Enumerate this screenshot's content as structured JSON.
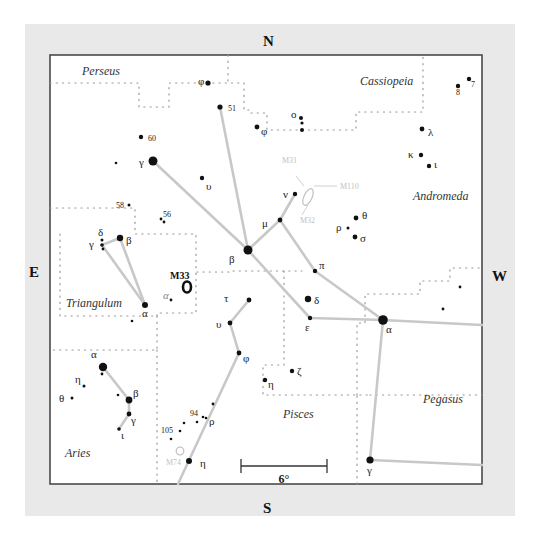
{
  "compass": {
    "north": "N",
    "south": "S",
    "east": "E",
    "west": "W"
  },
  "scale_bar": {
    "label": "6°"
  },
  "constellations": [
    {
      "name": "Perseus",
      "x": 82,
      "y": 75
    },
    {
      "name": "Cassiopeia",
      "x": 360,
      "y": 85
    },
    {
      "name": "Andromeda",
      "x": 413,
      "y": 200
    },
    {
      "name": "Triangulum",
      "x": 66,
      "y": 307
    },
    {
      "name": "Pisces",
      "x": 283,
      "y": 418
    },
    {
      "name": "Pegasus",
      "x": 423,
      "y": 403
    },
    {
      "name": "Aries",
      "x": 65,
      "y": 457
    }
  ],
  "deep_sky": [
    {
      "name": "M33",
      "label": "M33",
      "x": 187,
      "y": 287,
      "kind": "galaxy-bold",
      "lx": 170,
      "ly": 279
    },
    {
      "name": "M31",
      "label": "M31",
      "x": 308,
      "y": 197,
      "kind": "galaxy-faint",
      "lx": 282,
      "ly": 163
    },
    {
      "name": "M32",
      "label": "M32",
      "x": 308,
      "y": 197,
      "kind": "label-faint",
      "lx": 300,
      "ly": 223
    },
    {
      "name": "M110",
      "label": "M110",
      "x": 308,
      "y": 197,
      "kind": "label-faint",
      "lx": 340,
      "ly": 189
    },
    {
      "name": "M74",
      "label": "M74",
      "x": 180,
      "y": 451,
      "kind": "cluster-faint",
      "lx": 166,
      "ly": 465
    }
  ],
  "stars": [
    {
      "id": "per-phi",
      "label": "φ",
      "x": 208,
      "y": 83,
      "r": 2.6,
      "lx": 198,
      "ly": 85
    },
    {
      "id": "per-51",
      "label": "51",
      "x": 220,
      "y": 107,
      "r": 2.6,
      "lx": 228,
      "ly": 111
    },
    {
      "id": "per-60",
      "label": "60",
      "x": 141,
      "y": 137,
      "r": 2.2,
      "lx": 148,
      "ly": 141
    },
    {
      "id": "and-gamma",
      "label": "γ",
      "x": 153,
      "y": 161,
      "r": 4.5,
      "lx": 139,
      "ly": 166
    },
    {
      "id": "per-dot1",
      "label": "",
      "x": 116,
      "y": 163,
      "r": 1.3
    },
    {
      "id": "and-upsilon-n",
      "label": "υ",
      "x": 202,
      "y": 178,
      "r": 2.2,
      "lx": 206,
      "ly": 190
    },
    {
      "id": "and-phi",
      "label": "φ",
      "x": 257,
      "y": 127,
      "r": 2.4,
      "lx": 261,
      "ly": 135
    },
    {
      "id": "cas-omicron1",
      "label": "ο",
      "x": 301,
      "y": 118,
      "r": 2.0,
      "lx": 291,
      "ly": 118
    },
    {
      "id": "cas-omicron2",
      "label": "",
      "x": 302,
      "y": 123,
      "r": 1.6
    },
    {
      "id": "cas-omicron3",
      "label": "",
      "x": 302,
      "y": 130,
      "r": 2.0
    },
    {
      "id": "and-lambda",
      "label": "λ",
      "x": 422,
      "y": 129,
      "r": 2.4,
      "lx": 428,
      "ly": 136
    },
    {
      "id": "and-kappa",
      "label": "κ",
      "x": 421,
      "y": 155,
      "r": 2.2,
      "lx": 408,
      "ly": 158
    },
    {
      "id": "and-iota",
      "label": "ι",
      "x": 429,
      "y": 166,
      "r": 2.2,
      "lx": 434,
      "ly": 168
    },
    {
      "id": "cas-8",
      "label": "8",
      "x": 458,
      "y": 86,
      "r": 2.2,
      "lx": 456,
      "ly": 95
    },
    {
      "id": "cas-7",
      "label": "7",
      "x": 469,
      "y": 79,
      "r": 2.2,
      "lx": 471,
      "ly": 87
    },
    {
      "id": "and-nu",
      "label": "ν",
      "x": 295,
      "y": 194,
      "r": 2.2,
      "lx": 283,
      "ly": 198
    },
    {
      "id": "and-mu",
      "label": "μ",
      "x": 280,
      "y": 220,
      "r": 2.4,
      "lx": 262,
      "ly": 227
    },
    {
      "id": "and-theta",
      "label": "θ",
      "x": 356,
      "y": 218,
      "r": 2.4,
      "lx": 362,
      "ly": 219
    },
    {
      "id": "and-rho",
      "label": "ρ",
      "x": 348,
      "y": 228,
      "r": 1.5,
      "lx": 336,
      "ly": 231
    },
    {
      "id": "and-sigma",
      "label": "σ",
      "x": 355,
      "y": 237,
      "r": 2.4,
      "lx": 360,
      "ly": 242
    },
    {
      "id": "and-beta",
      "label": "β",
      "x": 248,
      "y": 250,
      "r": 4.5,
      "lx": 229,
      "ly": 263
    },
    {
      "id": "and-pi",
      "label": "π",
      "x": 315,
      "y": 271,
      "r": 2.2,
      "lx": 319,
      "ly": 269
    },
    {
      "id": "and-delta",
      "label": "δ",
      "x": 308,
      "y": 299,
      "r": 3.2,
      "lx": 314,
      "ly": 304
    },
    {
      "id": "and-epsilon",
      "label": "ε",
      "x": 310,
      "y": 318,
      "r": 2.2,
      "lx": 305,
      "ly": 331
    },
    {
      "id": "and-alpha",
      "label": "α",
      "x": 383,
      "y": 320,
      "r": 4.8,
      "lx": 386,
      "ly": 333
    },
    {
      "id": "peg-dot1",
      "label": "",
      "x": 460,
      "y": 287,
      "r": 1.4
    },
    {
      "id": "peg-dot2",
      "label": "",
      "x": 443,
      "y": 309,
      "r": 1.4
    },
    {
      "id": "peg-gamma",
      "label": "γ",
      "x": 370,
      "y": 460,
      "r": 3.6,
      "lx": 367,
      "ly": 474
    },
    {
      "id": "tri-58",
      "label": "58",
      "x": 129,
      "y": 205,
      "r": 1.5,
      "lx": 116,
      "ly": 208
    },
    {
      "id": "tri-56a",
      "label": "56",
      "x": 161,
      "y": 219,
      "r": 1.4,
      "lx": 163,
      "ly": 217
    },
    {
      "id": "tri-56b",
      "label": "",
      "x": 164,
      "y": 222,
      "r": 1.4
    },
    {
      "id": "tri-delta",
      "label": "δ",
      "x": 102,
      "y": 240,
      "r": 1.5,
      "lx": 98,
      "ly": 236
    },
    {
      "id": "tri-gamma",
      "label": "γ",
      "x": 102,
      "y": 245,
      "r": 1.8,
      "lx": 89,
      "ly": 248
    },
    {
      "id": "tri-gamma2",
      "label": "",
      "x": 103,
      "y": 249,
      "r": 1.4
    },
    {
      "id": "tri-beta",
      "label": "β",
      "x": 120,
      "y": 238,
      "r": 3.2,
      "lx": 126,
      "ly": 244
    },
    {
      "id": "tri-alpha",
      "label": "α",
      "x": 145,
      "y": 305,
      "r": 3.0,
      "lx": 142,
      "ly": 317
    },
    {
      "id": "tri-alpha-small",
      "label": "α",
      "x": 171,
      "y": 300,
      "r": 1.4,
      "lx": 163,
      "ly": 299,
      "faint": true
    },
    {
      "id": "tri-dot1",
      "label": "",
      "x": 132,
      "y": 321,
      "r": 1.3
    },
    {
      "id": "psc-tau",
      "label": "τ",
      "x": 249,
      "y": 300,
      "r": 2.4,
      "lx": 224,
      "ly": 302
    },
    {
      "id": "psc-upsilon",
      "label": "υ",
      "x": 230,
      "y": 323,
      "r": 2.4,
      "lx": 216,
      "ly": 328
    },
    {
      "id": "psc-phi",
      "label": "φ",
      "x": 239,
      "y": 353,
      "r": 2.4,
      "lx": 243,
      "ly": 362
    },
    {
      "id": "psc-zeta",
      "label": "ζ",
      "x": 292,
      "y": 371,
      "r": 2.2,
      "lx": 297,
      "ly": 375
    },
    {
      "id": "psc-eta-n",
      "label": "η",
      "x": 265,
      "y": 380,
      "r": 2.2,
      "lx": 268,
      "ly": 388
    },
    {
      "id": "psc-dot1",
      "label": "",
      "x": 213,
      "y": 404,
      "r": 1.4
    },
    {
      "id": "psc-94",
      "label": "94",
      "x": 203,
      "y": 417,
      "r": 1.3,
      "lx": 190,
      "ly": 416
    },
    {
      "id": "psc-rho",
      "label": "ρ",
      "x": 206,
      "y": 418,
      "r": 1.3,
      "lx": 209,
      "ly": 425
    },
    {
      "id": "psc-dot2",
      "label": "",
      "x": 197,
      "y": 422,
      "r": 1.3
    },
    {
      "id": "psc-dot3",
      "label": "",
      "x": 184,
      "y": 423,
      "r": 1.3
    },
    {
      "id": "psc-105",
      "label": "105",
      "x": 180,
      "y": 431,
      "r": 1.3,
      "lx": 161,
      "ly": 433
    },
    {
      "id": "psc-dot4",
      "label": "",
      "x": 171,
      "y": 439,
      "r": 1.3
    },
    {
      "id": "psc-eta",
      "label": "η",
      "x": 189,
      "y": 461,
      "r": 3.0,
      "lx": 200,
      "ly": 467
    },
    {
      "id": "ari-alpha",
      "label": "α",
      "x": 103,
      "y": 367,
      "r": 4.2,
      "lx": 91,
      "ly": 358
    },
    {
      "id": "ari-alpha-dot",
      "label": "",
      "x": 102,
      "y": 374,
      "r": 1.4
    },
    {
      "id": "ari-eta",
      "label": "η",
      "x": 84,
      "y": 386,
      "r": 1.5,
      "lx": 75,
      "ly": 383
    },
    {
      "id": "ari-theta",
      "label": "θ",
      "x": 72,
      "y": 398,
      "r": 1.5,
      "lx": 59,
      "ly": 402
    },
    {
      "id": "ari-dot1",
      "label": "",
      "x": 118,
      "y": 395,
      "r": 1.3
    },
    {
      "id": "ari-beta",
      "label": "β",
      "x": 129,
      "y": 400,
      "r": 3.4,
      "lx": 133,
      "ly": 397
    },
    {
      "id": "ari-gamma",
      "label": "γ",
      "x": 129,
      "y": 414,
      "r": 2.4,
      "lx": 131,
      "ly": 424
    },
    {
      "id": "ari-iota",
      "label": "ι",
      "x": 119,
      "y": 429,
      "r": 1.8,
      "lx": 121,
      "ly": 439
    }
  ],
  "lines": [
    [
      [
        220,
        107
      ],
      [
        248,
        250
      ]
    ],
    [
      [
        153,
        161
      ],
      [
        248,
        250
      ]
    ],
    [
      [
        248,
        250
      ],
      [
        280,
        220
      ]
    ],
    [
      [
        280,
        220
      ],
      [
        295,
        194
      ]
    ],
    [
      [
        248,
        250
      ],
      [
        310,
        318
      ]
    ],
    [
      [
        280,
        220
      ],
      [
        315,
        271
      ]
    ],
    [
      [
        315,
        271
      ],
      [
        383,
        320
      ]
    ],
    [
      [
        310,
        318
      ],
      [
        383,
        320
      ]
    ],
    [
      [
        383,
        320
      ],
      [
        482,
        325
      ]
    ],
    [
      [
        383,
        320
      ],
      [
        370,
        460
      ]
    ],
    [
      [
        370,
        460
      ],
      [
        482,
        465
      ]
    ],
    [
      [
        102,
        245
      ],
      [
        120,
        238
      ]
    ],
    [
      [
        102,
        245
      ],
      [
        145,
        305
      ]
    ],
    [
      [
        120,
        238
      ],
      [
        145,
        305
      ]
    ],
    [
      [
        249,
        300
      ],
      [
        230,
        323
      ]
    ],
    [
      [
        230,
        323
      ],
      [
        239,
        353
      ]
    ],
    [
      [
        239,
        353
      ],
      [
        178,
        484
      ]
    ],
    [
      [
        103,
        367
      ],
      [
        129,
        400
      ]
    ],
    [
      [
        129,
        400
      ],
      [
        129,
        414
      ]
    ],
    [
      [
        129,
        414
      ],
      [
        119,
        429
      ]
    ]
  ],
  "boundaries": [
    [
      [
        50,
        83
      ],
      [
        139,
        83
      ],
      [
        139,
        107
      ],
      [
        169,
        107
      ],
      [
        169,
        83
      ],
      [
        244,
        83
      ],
      [
        244,
        110
      ],
      [
        250,
        110
      ],
      [
        250,
        113
      ],
      [
        267,
        113
      ],
      [
        267,
        130
      ],
      [
        356,
        130
      ],
      [
        356,
        112
      ],
      [
        423,
        112
      ],
      [
        423,
        55
      ]
    ],
    [
      [
        228,
        55
      ],
      [
        228,
        83
      ]
    ],
    [
      [
        50,
        208
      ],
      [
        135,
        208
      ],
      [
        135,
        234
      ],
      [
        196,
        234
      ],
      [
        196,
        272
      ],
      [
        230,
        272
      ],
      [
        230,
        271
      ],
      [
        302,
        271
      ]
    ],
    [
      [
        60,
        234
      ],
      [
        60,
        316
      ],
      [
        157,
        316
      ]
    ],
    [
      [
        157,
        316
      ],
      [
        157,
        350
      ],
      [
        50,
        350
      ]
    ],
    [
      [
        157,
        316
      ],
      [
        157,
        313
      ],
      [
        196,
        313
      ],
      [
        196,
        272
      ]
    ],
    [
      [
        157,
        350
      ],
      [
        157,
        484
      ]
    ],
    [
      [
        284,
        271
      ],
      [
        284,
        365
      ],
      [
        263,
        365
      ],
      [
        263,
        395
      ],
      [
        370,
        395
      ]
    ],
    [
      [
        370,
        395
      ],
      [
        482,
        395
      ]
    ],
    [
      [
        357,
        484
      ],
      [
        357,
        395
      ]
    ],
    [
      [
        357,
        395
      ],
      [
        357,
        323
      ],
      [
        365,
        323
      ],
      [
        365,
        294
      ],
      [
        420,
        294
      ],
      [
        420,
        281
      ],
      [
        450,
        281
      ],
      [
        450,
        268
      ],
      [
        482,
        268
      ]
    ]
  ],
  "chart_data": {
    "type": "star_chart",
    "title": "",
    "orientation": {
      "top": "N",
      "bottom": "S",
      "left": "E",
      "right": "W"
    },
    "scale": "6°",
    "constellations": [
      "Perseus",
      "Cassiopeia",
      "Andromeda",
      "Triangulum",
      "Pisces",
      "Pegasus",
      "Aries"
    ],
    "deep_sky_objects": [
      "M31",
      "M32",
      "M110",
      "M33",
      "M74"
    ]
  }
}
